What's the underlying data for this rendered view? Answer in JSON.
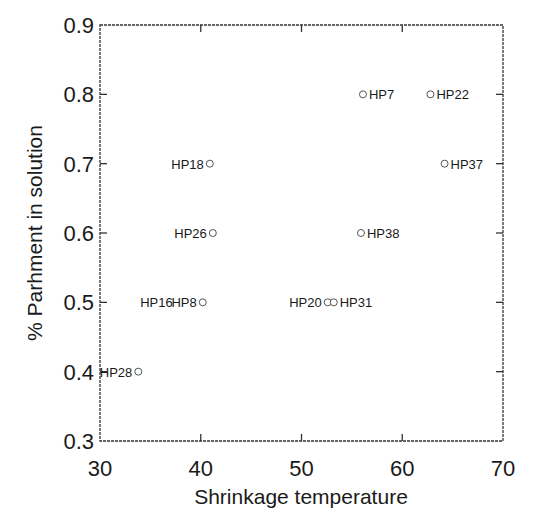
{
  "chart_data": {
    "type": "scatter",
    "title": "",
    "xlabel": "Shrinkage temperature",
    "ylabel": "% Parhment in solution",
    "xlim": [
      30,
      70
    ],
    "ylim": [
      0.3,
      0.9
    ],
    "xticks": [
      30,
      40,
      50,
      60,
      70
    ],
    "yticks": [
      0.3,
      0.4,
      0.5,
      0.6,
      0.7,
      0.8,
      0.9
    ],
    "xtick_labels": [
      "30",
      "40",
      "50",
      "60",
      "70"
    ],
    "ytick_labels": [
      "0.3",
      "0.4",
      "0.5",
      "0.6",
      "0.7",
      "0.8",
      "0.9"
    ],
    "grid": false,
    "legend": null,
    "marker": "open-circle",
    "points": [
      {
        "label": "HP7",
        "x": 56.1,
        "y": 0.8,
        "label_side": "right"
      },
      {
        "label": "HP22",
        "x": 62.8,
        "y": 0.8,
        "label_side": "right"
      },
      {
        "label": "HP37",
        "x": 64.2,
        "y": 0.7,
        "label_side": "right"
      },
      {
        "label": "HP18",
        "x": 40.9,
        "y": 0.7,
        "label_side": "left"
      },
      {
        "label": "HP26",
        "x": 41.2,
        "y": 0.6,
        "label_side": "left"
      },
      {
        "label": "HP38",
        "x": 55.9,
        "y": 0.6,
        "label_side": "right"
      },
      {
        "label": "HP8",
        "x": 40.2,
        "y": 0.5,
        "label_side": "left"
      },
      {
        "label": "HP16",
        "x": 40.2,
        "y": 0.5,
        "label_side": "left-far"
      },
      {
        "label": "HP20",
        "x": 52.6,
        "y": 0.5,
        "label_side": "left"
      },
      {
        "label": "HP31",
        "x": 53.2,
        "y": 0.5,
        "label_side": "right"
      },
      {
        "label": "HP28",
        "x": 33.8,
        "y": 0.4,
        "label_side": "left"
      }
    ]
  }
}
